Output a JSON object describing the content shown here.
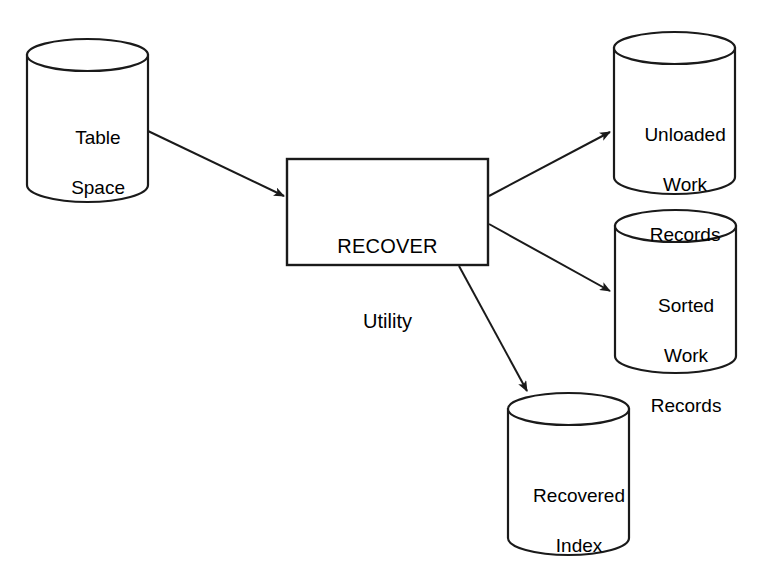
{
  "diagram": {
    "type": "data-flow-diagram",
    "background_color": "#ffffff",
    "stroke_color": "#1a1a1a",
    "fill_color": "#ffffff",
    "process": {
      "id": "recover-utility",
      "shape": "rectangle",
      "label_line1": "RECOVER",
      "label_line2": "Utility",
      "x": 287,
      "y": 159,
      "width": 201,
      "height": 106
    },
    "stores": [
      {
        "id": "table-space",
        "shape": "cylinder",
        "role": "input",
        "lines": [
          "Table",
          "Space"
        ],
        "x": 27,
        "y": 40,
        "width": 121,
        "height": 160
      },
      {
        "id": "unloaded-work-records",
        "shape": "cylinder",
        "role": "output",
        "lines": [
          "Unloaded",
          "Work",
          "Records"
        ],
        "x": 614,
        "y": 33,
        "width": 121,
        "height": 159
      },
      {
        "id": "sorted-work-records",
        "shape": "cylinder",
        "role": "output",
        "lines": [
          "Sorted",
          "Work",
          "Records"
        ],
        "x": 615,
        "y": 210,
        "width": 121,
        "height": 162
      },
      {
        "id": "recovered-index",
        "shape": "cylinder",
        "role": "output",
        "lines": [
          "Recovered",
          "Index"
        ],
        "x": 508,
        "y": 393,
        "width": 121,
        "height": 160
      }
    ],
    "arrows": [
      {
        "id": "table-space-to-recover",
        "from": "table-space",
        "to": "recover-utility",
        "x1": 148,
        "y1": 131,
        "x2": 286,
        "y2": 197
      },
      {
        "id": "recover-to-unloaded-work-records",
        "from": "recover-utility",
        "to": "unloaded-work-records",
        "x1": 489,
        "y1": 196,
        "x2": 612,
        "y2": 131
      },
      {
        "id": "recover-to-sorted-work-records",
        "from": "recover-utility",
        "to": "sorted-work-records",
        "x1": 489,
        "y1": 224,
        "x2": 612,
        "y2": 293
      },
      {
        "id": "recover-to-recovered-index",
        "from": "recover-utility",
        "to": "recovered-index",
        "x1": 459,
        "y1": 266,
        "x2": 528,
        "y2": 394
      }
    ]
  }
}
